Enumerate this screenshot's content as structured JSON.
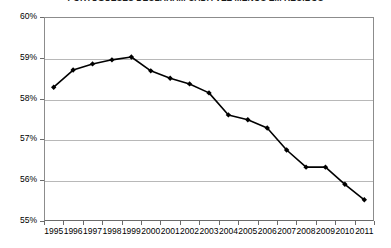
{
  "chart_data": {
    "type": "line",
    "title": "PORTUGUESES DECLARAM CADA VEZ MENOS EM RECIBOS",
    "subtitle": "",
    "xlabel": "",
    "ylabel": "",
    "categories": [
      "1995",
      "1996",
      "1997",
      "1998",
      "1999",
      "2000",
      "2001",
      "2002",
      "2003",
      "2004",
      "2005",
      "2006",
      "2007",
      "2008",
      "2009",
      "2010",
      "2011"
    ],
    "values": [
      58.28,
      58.7,
      58.85,
      58.95,
      59.02,
      58.68,
      58.5,
      58.36,
      58.14,
      57.6,
      57.48,
      57.28,
      56.74,
      56.32,
      56.32,
      55.9,
      55.52
    ],
    "series": [
      {
        "name": "Percentagem",
        "values": [
          58.28,
          58.7,
          58.85,
          58.95,
          59.02,
          58.68,
          58.5,
          58.36,
          58.14,
          57.6,
          57.48,
          57.28,
          56.74,
          56.32,
          56.32,
          55.9,
          55.52
        ]
      }
    ],
    "ylim": [
      55,
      60
    ],
    "yticks": [
      55,
      56,
      57,
      58,
      59,
      60
    ],
    "ytick_labels": [
      "55%",
      "56%",
      "57%",
      "58%",
      "59%",
      "60%"
    ],
    "xtick_labels": [
      "1995",
      "1996",
      "1997",
      "1998",
      "1999",
      "2000",
      "2001",
      "2002",
      "2003",
      "2004",
      "2005",
      "2006",
      "2007",
      "2008",
      "2009",
      "2010",
      "2011"
    ],
    "grid": true,
    "grid_axis": "y",
    "legend": false,
    "legend_position": "none",
    "line_color": "#000000",
    "marker": "diamond",
    "marker_color": "#000000",
    "background_color": "#ffffff",
    "gridline_color": "#b8b8b8",
    "axis_color": "#6b6b6b"
  }
}
